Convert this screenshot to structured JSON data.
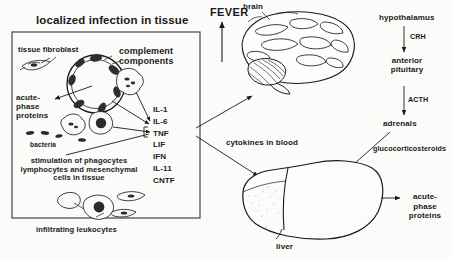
{
  "figure": {
    "title": "localized infection in tissue",
    "kind": "acute-phase-response-diagram"
  },
  "tissue_panel": {
    "fibroblast_label": "tissue fibroblast",
    "complement_label_line1": "complement",
    "complement_label_line2": "components",
    "acute_phase_line1": "acute-",
    "acute_phase_line2": "phase",
    "acute_phase_line3": "proteins",
    "bacteria_label": "bacteria",
    "stimulation_line1": "stimulation of phagocytes",
    "stimulation_line2": "lymphocytes and mesenchymal",
    "stimulation_line3": "cells in tissue",
    "leukocytes_label": "infiltrating leukocytes"
  },
  "cytokines": {
    "list": [
      "IL-1",
      "IL-6",
      "TNF",
      "LIF",
      "IFN",
      "IL-11",
      "CNTF"
    ],
    "blood_label": "cytokines in blood"
  },
  "brain_axis": {
    "fever_label": "FEVER",
    "brain_label": "brain",
    "hypothalamus_label": "hypothalamus",
    "crh_label": "CRH",
    "anterior_pituitary_line1": "anterior",
    "anterior_pituitary_line2": "pituitary",
    "acth_label": "ACTH",
    "adrenals_label": "adrenals",
    "glucocorticosteroids_label": "glucocorticosteroids"
  },
  "liver": {
    "label": "liver",
    "output_line1": "acute-",
    "output_line2": "phase",
    "output_line3": "proteins"
  },
  "colors": {
    "ink": "#1a1a1a",
    "paper": "#fbfbf9",
    "fill_gray": "#e9e9e6"
  }
}
